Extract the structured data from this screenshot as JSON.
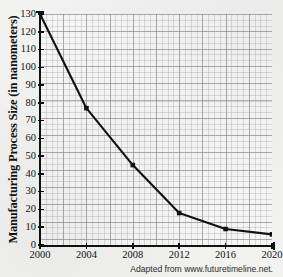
{
  "chart_data": {
    "type": "line",
    "title": "",
    "xlabel": "",
    "ylabel": "Manufacturing Process Size (in nanometers)",
    "x": [
      2000,
      2004,
      2008,
      2012,
      2016,
      2020
    ],
    "values": [
      130,
      77,
      45,
      18,
      9,
      6
    ],
    "series": [
      {
        "name": "Manufacturing Process Size",
        "values": [
          130,
          77,
          45,
          18,
          9,
          6
        ]
      }
    ],
    "categories": [
      "2000",
      "2004",
      "2008",
      "2012",
      "2016",
      "2020"
    ],
    "xlim": [
      2000,
      2020
    ],
    "ylim": [
      0,
      130
    ],
    "xticks": [
      "2000",
      "2004",
      "2008",
      "2012",
      "2016",
      "2020"
    ],
    "yticks": [
      "0",
      "10",
      "20",
      "30",
      "40",
      "50",
      "60",
      "70",
      "80",
      "90",
      "100",
      "110",
      "120",
      "130"
    ],
    "grid": true,
    "minor_grid": true,
    "legend": false,
    "legend_position": "none",
    "marker": "square",
    "line_color": "#111111",
    "marker_color": "#111111",
    "grid_color": "#9696a5",
    "background_color": "#f6f6f4"
  },
  "axes": {
    "y_title": "Manufacturing Process Size (in nanometers)",
    "y_ticks": [
      "130",
      "120",
      "110",
      "100",
      "90",
      "80",
      "70",
      "60",
      "50",
      "40",
      "30",
      "20",
      "10",
      "0"
    ],
    "x_ticks": [
      "2000",
      "2004",
      "2008",
      "2012",
      "2016",
      "2020"
    ]
  },
  "footer": {
    "attribution": "Adapted from www.futuretimeline.net."
  },
  "header": {
    "cropped_title": ""
  }
}
